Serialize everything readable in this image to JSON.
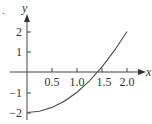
{
  "chart_data": {
    "type": "line",
    "title": "",
    "xlabel": "x",
    "ylabel": "y",
    "xlim": [
      0,
      2.2
    ],
    "ylim": [
      -2.2,
      2.6
    ],
    "grid": false,
    "x_ticks": [
      "0.5",
      "1.0",
      "1.5",
      "2.0"
    ],
    "y_ticks": [
      "2",
      "1",
      "−1",
      "−2"
    ],
    "series": [
      {
        "name": "y = x^2 - 2",
        "x": [
          0,
          0.25,
          0.5,
          0.75,
          1.0,
          1.25,
          1.5,
          1.75,
          2.0
        ],
        "values": [
          -2,
          -1.9375,
          -1.75,
          -1.4375,
          -1.0,
          -0.4375,
          0.25,
          1.0625,
          2.0
        ]
      }
    ],
    "annotations": [
      "."
    ]
  }
}
